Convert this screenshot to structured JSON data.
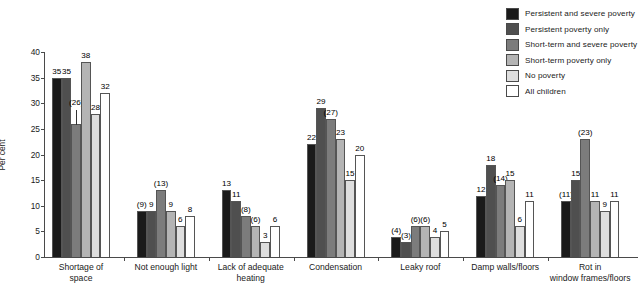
{
  "chart_data": {
    "type": "bar",
    "title": "",
    "subtitle": "",
    "xlabel": "",
    "ylabel": "Per cent",
    "ylim": [
      0,
      40
    ],
    "yticks": [
      0,
      5,
      10,
      15,
      20,
      25,
      30,
      35,
      40
    ],
    "grid": false,
    "legend_position": "top-right",
    "categories": [
      "Shortage of space",
      "Not enough light",
      "Lack of adequate heating",
      "Condensation",
      "Leaky roof",
      "Damp walls/floors",
      "Rot in window frames/floors"
    ],
    "category_lines": [
      [
        "Shortage of",
        "space"
      ],
      [
        "Not enough light"
      ],
      [
        "Lack of adequate",
        "heating"
      ],
      [
        "Condensation"
      ],
      [
        "Leaky roof"
      ],
      [
        "Damp walls/floors"
      ],
      [
        "Rot in",
        "window frames/floors"
      ]
    ],
    "series": [
      {
        "name": "Persistent and severe poverty",
        "color": "#1a1a1a",
        "values": [
          35,
          9,
          13,
          22,
          4,
          12,
          11
        ],
        "labels": [
          "35",
          "(9)",
          "13",
          "22",
          "(4)",
          "12",
          "(11)"
        ]
      },
      {
        "name": "Persistent poverty only",
        "color": "#4f4f4f",
        "values": [
          35,
          9,
          11,
          29,
          3,
          18,
          15
        ],
        "labels": [
          "35",
          "9",
          "11",
          "29",
          "(3)",
          "18",
          "15"
        ]
      },
      {
        "name": "Short-term and severe poverty",
        "color": "#7c7c7c",
        "values": [
          26,
          13,
          8,
          27,
          6,
          14,
          23
        ],
        "labels": [
          "(26)",
          "(13)",
          "(8)",
          "(27)",
          "(6)",
          "(14)",
          "(23)"
        ]
      },
      {
        "name": "Short-term poverty only",
        "color": "#b4b4b4",
        "values": [
          38,
          9,
          6,
          23,
          6,
          15,
          11
        ],
        "labels": [
          "38",
          "9",
          "(6)",
          "23",
          "(6)",
          "15",
          "11"
        ]
      },
      {
        "name": "No poverty",
        "color": "#dedede",
        "values": [
          28,
          6,
          3,
          15,
          4,
          6,
          9
        ],
        "labels": [
          "28",
          "6",
          "3",
          "15",
          "4",
          "6",
          "9"
        ]
      },
      {
        "name": "All children",
        "color": "#ffffff",
        "values": [
          32,
          8,
          6,
          20,
          5,
          11,
          11
        ],
        "labels": [
          "32",
          "8",
          "6",
          "20",
          "5",
          "11",
          "11"
        ]
      }
    ]
  },
  "legend": {
    "items": [
      {
        "label": "Persistent and severe poverty",
        "color": "#1a1a1a"
      },
      {
        "label": "Persistent poverty only",
        "color": "#4f4f4f"
      },
      {
        "label": "Short-term and severe poverty",
        "color": "#7c7c7c"
      },
      {
        "label": "Short-term poverty only",
        "color": "#b4b4b4"
      },
      {
        "label": "No poverty",
        "color": "#dedede"
      },
      {
        "label": "All children",
        "color": "#ffffff"
      }
    ]
  }
}
